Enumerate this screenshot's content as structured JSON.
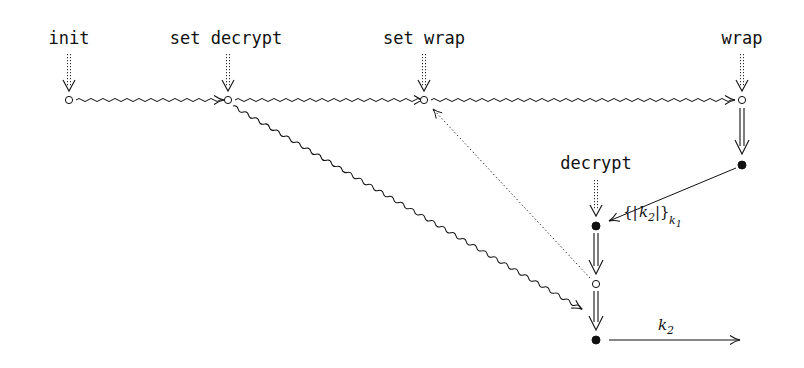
{
  "diagram": {
    "strand_labels": {
      "init": "init",
      "set_decrypt": "set decrypt",
      "set_wrap": "set wrap",
      "wrap": "wrap",
      "decrypt": "decrypt"
    },
    "edge_labels": {
      "wrapped_key_open": "{|",
      "wrapped_key_k": "k",
      "wrapped_key_k_sub": "2",
      "wrapped_key_close": "|}",
      "wrapped_key_outer_sub": "k",
      "wrapped_key_outer_sub2": "1",
      "output_k": "k",
      "output_k_sub": "2"
    },
    "nodes": [
      {
        "id": "n_init",
        "type": "hollow",
        "x": 69,
        "y": 100
      },
      {
        "id": "n_setdec",
        "type": "hollow",
        "x": 228,
        "y": 100
      },
      {
        "id": "n_setwrap",
        "type": "hollow",
        "x": 424,
        "y": 100
      },
      {
        "id": "n_wrap1",
        "type": "hollow",
        "x": 742,
        "y": 100
      },
      {
        "id": "n_wrap2",
        "type": "filled",
        "x": 742,
        "y": 165
      },
      {
        "id": "n_dec1",
        "type": "filled",
        "x": 596,
        "y": 226
      },
      {
        "id": "n_dec2",
        "type": "hollow",
        "x": 596,
        "y": 284
      },
      {
        "id": "n_dec3",
        "type": "filled",
        "x": 596,
        "y": 340
      }
    ],
    "edges": [
      {
        "from": "n_init",
        "to": "n_setdec",
        "style": "wavy"
      },
      {
        "from": "n_setdec",
        "to": "n_setwrap",
        "style": "wavy"
      },
      {
        "from": "n_setwrap",
        "to": "n_wrap1",
        "style": "wavy"
      },
      {
        "from": "n_setdec",
        "to": "n_dec2",
        "style": "wavy"
      },
      {
        "from": "n_dec2",
        "to": "n_setwrap",
        "style": "dotted"
      },
      {
        "from": "n_wrap1",
        "to": "n_wrap2",
        "style": "double"
      },
      {
        "from": "n_wrap2",
        "to": "n_dec1",
        "style": "solid",
        "label": "{|k2|}k1"
      },
      {
        "from": "n_dec1",
        "to": "n_dec2",
        "style": "double"
      },
      {
        "from": "n_dec2",
        "to": "n_dec3",
        "style": "double"
      },
      {
        "from": "n_dec3",
        "to": "out",
        "style": "solid",
        "label": "k2"
      }
    ],
    "colors": {
      "ink": "#111111",
      "background": "#ffffff"
    }
  }
}
